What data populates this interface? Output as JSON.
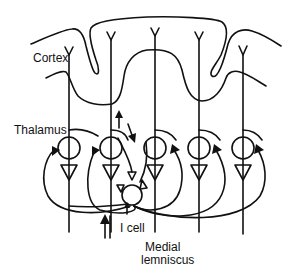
{
  "diagram": {
    "type": "thalamocortical circuit schematic",
    "labels": {
      "cortex": "Cortex",
      "thalamus": "Thalamus",
      "i_cell": "I cell",
      "medial_lemniscus_line1": "Medial",
      "medial_lemniscus_line2": "lemniscus"
    },
    "neurons": {
      "thalamic_relay_count": 5,
      "relay_x": [
        69,
        108,
        152,
        196,
        240
      ],
      "interneuron": "I cell"
    },
    "arrows": [
      {
        "name": "ascending-cortical-arrow",
        "direction": "up"
      },
      {
        "name": "descending-feedback-arrow",
        "direction": "down"
      },
      {
        "name": "lemniscal-input-arrow",
        "direction": "up"
      },
      {
        "name": "i-cell-input-arrow",
        "direction": "up"
      }
    ],
    "colors": {
      "ink": "#111111",
      "background": "#ffffff"
    }
  }
}
